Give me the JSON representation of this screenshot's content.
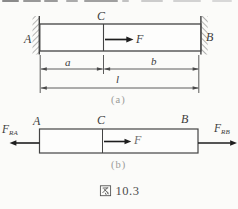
{
  "figure": {
    "caption_full": "图 10.3",
    "caption_cjk": "图",
    "caption_number": "10.3"
  },
  "diagram_a": {
    "caption": "(a)",
    "labels": {
      "left_support": "A",
      "load_point": "C",
      "right_support": "B",
      "force": "F"
    },
    "dimensions": {
      "left_segment": "a",
      "right_segment": "b",
      "total_length": "l"
    }
  },
  "diagram_b": {
    "caption": "(b)",
    "labels": {
      "left_end": "A",
      "load_point": "C",
      "right_end": "B",
      "force": "F"
    },
    "reactions": {
      "left": {
        "symbol": "F",
        "subscript": "RA"
      },
      "right": {
        "symbol": "F",
        "subscript": "RB"
      }
    }
  },
  "colors": {
    "line": "#3f3f3f",
    "text": "#3c3c3c",
    "caption_gray": "#9a9a98",
    "background": "#fbfbf9"
  }
}
